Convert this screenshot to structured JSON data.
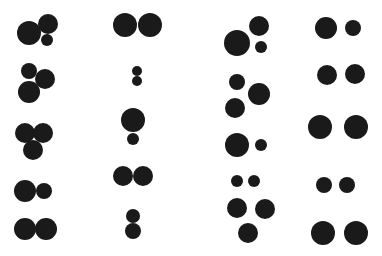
{
  "figure": {
    "width": 382,
    "height": 256,
    "background": "#ffffff",
    "dot_color": "#1a1a1a",
    "columns": 4,
    "rows": 5
  },
  "groups": [
    {
      "col": 1,
      "row": 1,
      "circles": [
        [
          29,
          33,
          12
        ],
        [
          48,
          24,
          10
        ],
        [
          47,
          40,
          6
        ]
      ]
    },
    {
      "col": 1,
      "row": 2,
      "circles": [
        [
          29,
          71,
          8
        ],
        [
          45,
          79,
          10
        ],
        [
          29,
          92,
          11
        ]
      ]
    },
    {
      "col": 1,
      "row": 3,
      "circles": [
        [
          25,
          133,
          10
        ],
        [
          43,
          133,
          10
        ],
        [
          33,
          150,
          10
        ]
      ]
    },
    {
      "col": 1,
      "row": 4,
      "circles": [
        [
          25,
          191,
          11
        ],
        [
          44,
          191,
          8
        ]
      ]
    },
    {
      "col": 1,
      "row": 5,
      "circles": [
        [
          25,
          229,
          11
        ],
        [
          46,
          229,
          11
        ]
      ]
    },
    {
      "col": 2,
      "row": 1,
      "circles": [
        [
          125,
          25,
          12
        ],
        [
          150,
          25,
          12
        ]
      ]
    },
    {
      "col": 2,
      "row": 2,
      "circles": [
        [
          137,
          71,
          5
        ],
        [
          137,
          81,
          5
        ]
      ]
    },
    {
      "col": 2,
      "row": 3,
      "circles": [
        [
          133,
          120,
          12
        ],
        [
          133,
          139,
          6
        ]
      ]
    },
    {
      "col": 2,
      "row": 4,
      "circles": [
        [
          123,
          176,
          10
        ],
        [
          143,
          176,
          10
        ]
      ]
    },
    {
      "col": 2,
      "row": 5,
      "circles": [
        [
          133,
          216,
          7
        ],
        [
          133,
          231,
          8
        ]
      ]
    },
    {
      "col": 3,
      "row": 1,
      "circles": [
        [
          237,
          43,
          13
        ],
        [
          259,
          26,
          10
        ],
        [
          261,
          47,
          6
        ]
      ]
    },
    {
      "col": 3,
      "row": 2,
      "circles": [
        [
          237,
          82,
          8
        ],
        [
          259,
          94,
          11
        ],
        [
          235,
          108,
          10
        ]
      ]
    },
    {
      "col": 3,
      "row": 3,
      "circles": [
        [
          237,
          145,
          12
        ],
        [
          261,
          145,
          6
        ]
      ]
    },
    {
      "col": 3,
      "row": 4,
      "circles": [
        [
          237,
          181,
          6
        ],
        [
          254,
          181,
          6
        ]
      ]
    },
    {
      "col": 3,
      "row": 5,
      "circles": [
        [
          237,
          208,
          10
        ],
        [
          265,
          209,
          10
        ],
        [
          248,
          233,
          10
        ]
      ]
    },
    {
      "col": 4,
      "row": 1,
      "circles": [
        [
          326,
          28,
          11
        ],
        [
          353,
          28,
          8
        ]
      ]
    },
    {
      "col": 4,
      "row": 2,
      "circles": [
        [
          327,
          75,
          10
        ],
        [
          355,
          74,
          10
        ]
      ]
    },
    {
      "col": 4,
      "row": 3,
      "circles": [
        [
          320,
          127,
          12
        ],
        [
          356,
          127,
          12
        ]
      ]
    },
    {
      "col": 4,
      "row": 4,
      "circles": [
        [
          324,
          185,
          8
        ],
        [
          347,
          185,
          8
        ]
      ]
    },
    {
      "col": 4,
      "row": 5,
      "circles": [
        [
          323,
          233,
          12
        ],
        [
          356,
          233,
          12
        ]
      ]
    }
  ]
}
